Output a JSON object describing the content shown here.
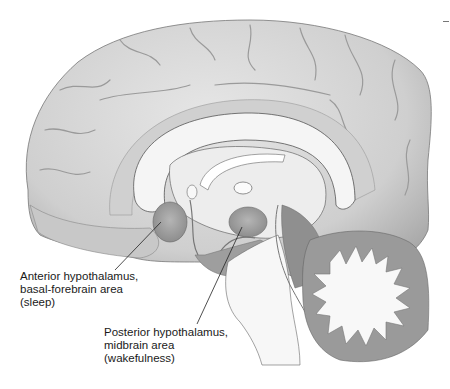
{
  "figure": {
    "colors": {
      "cortex": "#d4d4d4",
      "cortex_shadow": "#a9a9a9",
      "white_matter": "#f4f4f4",
      "deep_structure": "#c2c2c2",
      "nucleus_highlight": "#9e9e9e",
      "brainstem": "#b8b8b8",
      "cerebellum": "#9a9a9a",
      "outline": "#555555",
      "label_text": "#1a1a1a"
    }
  },
  "labels": [
    {
      "id": "anterior",
      "lines": [
        "Anterior hypothalamus,",
        "basal-forebrain area",
        "(sleep)"
      ],
      "text": "Anterior hypothalamus,\nbasal-forebrain area\n(sleep)"
    },
    {
      "id": "posterior",
      "lines": [
        "Posterior hypothalamus,",
        "midbrain area",
        "(wakefulness)"
      ],
      "text": "Posterior hypothalamus,\nmidbrain area\n(wakefulness)"
    }
  ]
}
